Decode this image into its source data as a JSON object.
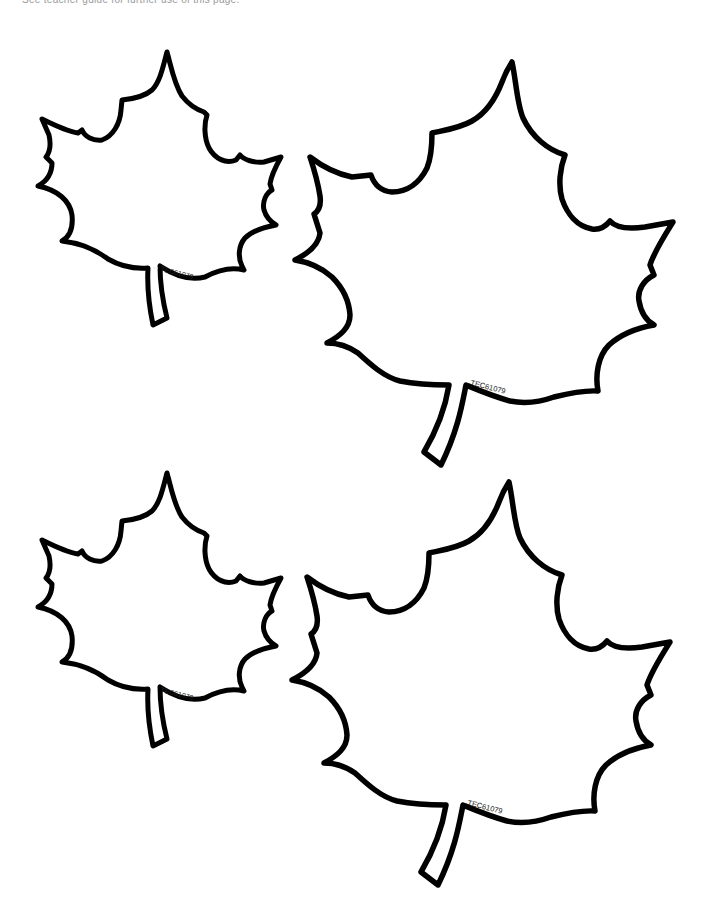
{
  "page": {
    "header_note": "See teacher guide for further use of this page.",
    "background": "#ffffff",
    "outline_color": "#000000"
  },
  "leaves": [
    {
      "id": "leaf-top-left",
      "size": "small",
      "code": "TEC61079"
    },
    {
      "id": "leaf-top-right",
      "size": "large",
      "code": "TEC61079"
    },
    {
      "id": "leaf-bottom-left",
      "size": "small",
      "code": "TEC61079"
    },
    {
      "id": "leaf-bottom-right",
      "size": "large",
      "code": "TEC61079"
    }
  ]
}
